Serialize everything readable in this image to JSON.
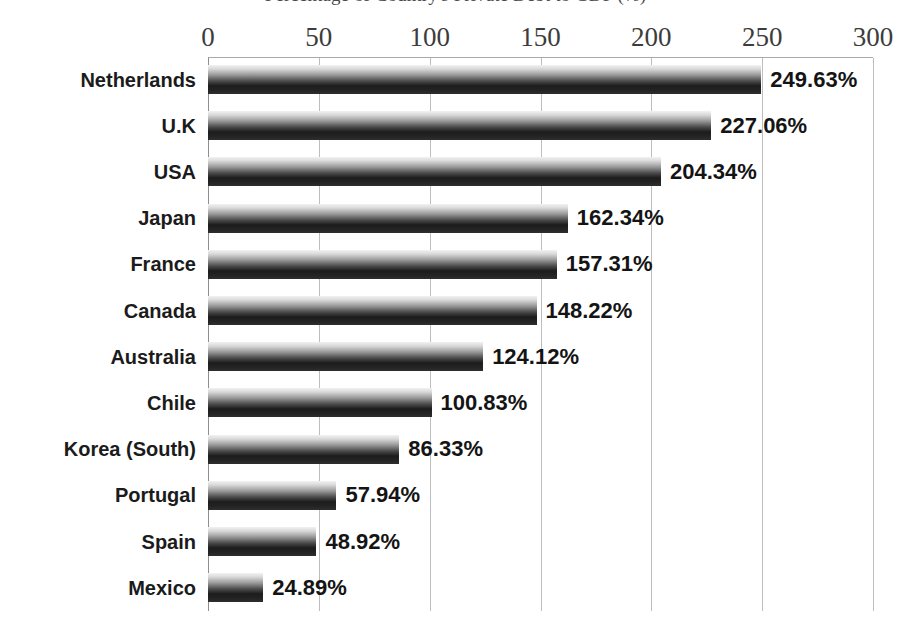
{
  "chart_data": {
    "type": "bar",
    "orientation": "horizontal",
    "title": "Percentage of Country's Private Debt to GDP (%)",
    "xlabel": "",
    "ylabel": "",
    "xlim": [
      0,
      300
    ],
    "xticks": [
      "0",
      "50",
      "100",
      "150",
      "200",
      "250",
      "300"
    ],
    "xtick_values": [
      0,
      50,
      100,
      150,
      200,
      250,
      300
    ],
    "grid": "vertical",
    "legend": "none",
    "categories": [
      "Netherlands",
      "U.K",
      "USA",
      "Japan",
      "France",
      "Canada",
      "Australia",
      "Chile",
      "Korea (South)",
      "Portugal",
      "Spain",
      "Mexico"
    ],
    "values": [
      249.63,
      227.06,
      204.34,
      162.34,
      157.31,
      148.22,
      124.12,
      100.83,
      86.33,
      57.94,
      48.92,
      24.89
    ],
    "data_labels": [
      "249.63%",
      "227.06%",
      "204.34%",
      "162.34%",
      "157.31%",
      "148.22%",
      "124.12%",
      "100.83%",
      "86.33%",
      "57.94%",
      "48.92%",
      "24.89%"
    ],
    "colors": {
      "bar_gradient_top": "#f2f2f2",
      "bar_gradient_bottom": "#1c1c1c",
      "gridline": "#bdbdbd",
      "axis_line": "#8e8e8e",
      "label_text": "#1b1b1b",
      "tick_text": "#3c3c3c",
      "background": "#ffffff"
    }
  }
}
